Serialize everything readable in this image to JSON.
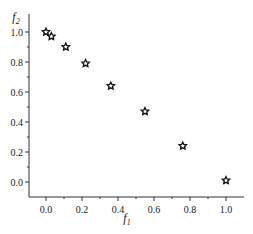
{
  "chart_data": {
    "type": "scatter",
    "title": "",
    "xlabel": "f1",
    "ylabel": "f2",
    "xlim": [
      -0.1,
      1.08
    ],
    "ylim": [
      -0.1,
      1.08
    ],
    "xticks": [
      "0.0",
      "0.2",
      "0.4",
      "0.6",
      "0.8",
      "1.0"
    ],
    "yticks": [
      "0.0",
      "0.2",
      "0.4",
      "0.6",
      "0.8",
      "1.0"
    ],
    "grid": false,
    "marker": "star-outline",
    "series": [
      {
        "name": "Pareto front",
        "x": [
          0.0,
          0.03,
          0.11,
          0.22,
          0.36,
          0.55,
          0.76,
          1.0
        ],
        "y": [
          1.0,
          0.97,
          0.9,
          0.79,
          0.64,
          0.47,
          0.24,
          0.01
        ]
      }
    ]
  }
}
